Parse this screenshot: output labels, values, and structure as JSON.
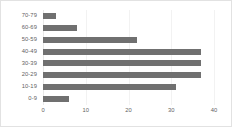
{
  "chart_data": {
    "type": "bar",
    "orientation": "horizontal",
    "title": "",
    "xlabel": "",
    "ylabel": "",
    "categories": [
      "70-79",
      "60-69",
      "50-59",
      "40-49",
      "30-39",
      "20-29",
      "10-19",
      "0-9"
    ],
    "values": [
      3,
      8,
      22,
      37,
      37,
      37,
      31,
      6
    ],
    "xlim": [
      0,
      40
    ],
    "xticks": [
      0,
      10,
      20,
      30,
      40
    ],
    "xtick_labels": [
      "0",
      "10",
      "20",
      "30",
      "40"
    ],
    "grid": true,
    "grid_axis": "x",
    "legend": false,
    "legend_position": "none",
    "bar_color": "#707070",
    "gridline_color": "#f2f2f2",
    "axis_text_color": "#5f5f5f",
    "frame_color": "#e2e2e2",
    "background_color": "#ffffff"
  }
}
